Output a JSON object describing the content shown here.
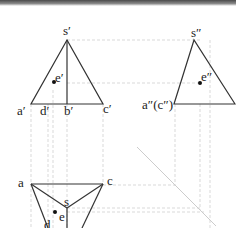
{
  "diagram": {
    "type": "orthographic-projection",
    "views": {
      "front": {
        "labels": {
          "apex": "s′",
          "e": "e′",
          "a": "a′",
          "d": "d′",
          "b": "b′",
          "c": "c′"
        }
      },
      "side": {
        "labels": {
          "apex": "s″",
          "e": "e″",
          "ac": "a″(c″)"
        }
      },
      "top": {
        "labels": {
          "a": "a",
          "c": "c",
          "s": "s",
          "e": "e",
          "d": "d"
        }
      }
    },
    "colors": {
      "line": "#333333",
      "projection": "#c8c8c8",
      "miter": "#cccccc",
      "point": "#111111"
    }
  }
}
